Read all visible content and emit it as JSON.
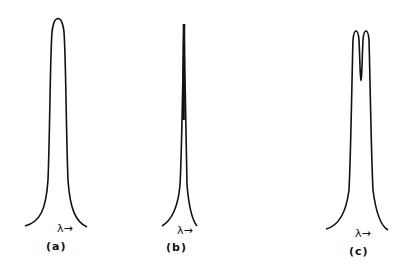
{
  "figure": {
    "panels": [
      {
        "id": "a",
        "caption": "(a)",
        "axis_label": "λ",
        "axis_arrow": "→",
        "description": "single broad peak"
      },
      {
        "id": "b",
        "caption": "(b)",
        "axis_label": "λ",
        "axis_arrow": "→",
        "description": "very narrow single line"
      },
      {
        "id": "c",
        "caption": "(c)",
        "axis_label": "λ",
        "axis_arrow": "→",
        "description": "peak split into doublet"
      }
    ],
    "colors": {
      "line": "#111111",
      "background": "#ffffff"
    }
  }
}
